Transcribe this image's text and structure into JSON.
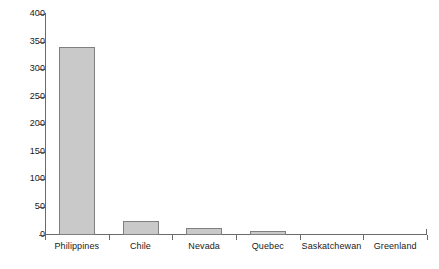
{
  "chart_data": {
    "type": "bar",
    "title": "",
    "subtitle": "",
    "xlabel": "",
    "ylabel": "",
    "categories": [
      "Philippines",
      "Chile",
      "Nevada",
      "Quebec",
      "Saskatchewan",
      "Greenland"
    ],
    "values": [
      340,
      24,
      11,
      6,
      2,
      0
    ],
    "ylim": [
      0,
      400
    ],
    "yticks": [
      0,
      50,
      100,
      150,
      200,
      250,
      300,
      350,
      400
    ],
    "ytick_labels": [
      "0",
      "50",
      "100",
      "150",
      "200",
      "250",
      "300",
      "350",
      "400"
    ],
    "grid": false,
    "legend": null,
    "bar_fill_color": "#c9c9c9",
    "bar_border_color": "#7f7f7f",
    "axis_color": "#6b6b6b",
    "text_color": "#1a1a1a",
    "background_color": "#ffffff"
  }
}
